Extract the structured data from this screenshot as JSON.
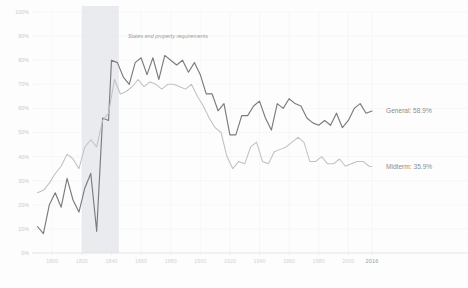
{
  "chart_data": {
    "type": "line",
    "title": "",
    "subtitle": "",
    "xlabel": "",
    "ylabel": "",
    "ylim": [
      0,
      100
    ],
    "xlim": [
      1789,
      2016
    ],
    "grid": true,
    "legend_position": "right-inline",
    "y_ticks": [
      "0%",
      "10%",
      "20%",
      "30%",
      "40%",
      "50%",
      "60%",
      "70%",
      "80%",
      "90%",
      "100%"
    ],
    "y_tick_values": [
      0,
      10,
      20,
      30,
      40,
      50,
      60,
      70,
      80,
      90,
      100
    ],
    "x_ticks": [
      "1800",
      "1820",
      "1840",
      "1860",
      "1880",
      "1900",
      "1920",
      "1940",
      "1960",
      "1980",
      "2000",
      "2016"
    ],
    "x_tick_values": [
      1800,
      1820,
      1840,
      1860,
      1880,
      1900,
      1920,
      1940,
      1960,
      1980,
      2000,
      2016
    ],
    "annotations": [
      {
        "name": "property-requirements-band",
        "text": "States end property requirements",
        "x_start": 1820,
        "x_end": 1845,
        "color": "#e4e7ea"
      }
    ],
    "series": [
      {
        "name": "General",
        "label": "General: 58.9%",
        "end_value": 58.9,
        "color": "#7b7b7f",
        "width": 1.15,
        "x": [
          1790,
          1794,
          1798,
          1802,
          1806,
          1810,
          1814,
          1818,
          1822,
          1826,
          1830,
          1834,
          1838,
          1840,
          1844,
          1848,
          1852,
          1856,
          1860,
          1864,
          1868,
          1872,
          1876,
          1880,
          1884,
          1888,
          1892,
          1896,
          1900,
          1904,
          1908,
          1912,
          1916,
          1920,
          1924,
          1928,
          1932,
          1936,
          1940,
          1944,
          1948,
          1952,
          1956,
          1960,
          1964,
          1968,
          1972,
          1976,
          1980,
          1984,
          1988,
          1992,
          1996,
          2000,
          2004,
          2008,
          2012,
          2016
        ],
        "values": [
          11.0,
          8.0,
          20.0,
          25.0,
          19.0,
          31.0,
          22.0,
          17.0,
          27.0,
          33.0,
          9.0,
          56.0,
          55.0,
          80.0,
          79.0,
          73.0,
          70.0,
          79.0,
          81.0,
          74.0,
          81.0,
          72.0,
          82.0,
          80.0,
          78.0,
          80.0,
          75.0,
          79.0,
          74.0,
          66.0,
          66.0,
          59.0,
          62.0,
          49.0,
          49.0,
          57.0,
          57.0,
          61.0,
          63.0,
          56.0,
          51.0,
          62.0,
          60.0,
          64.0,
          62.0,
          61.0,
          56.0,
          54.0,
          53.0,
          55.0,
          53.0,
          58.0,
          52.0,
          55.0,
          60.0,
          62.0,
          58.0,
          58.9
        ]
      },
      {
        "name": "Midterm",
        "label": "Midterm: 35.9%",
        "end_value": 35.9,
        "color": "#c0c1c4",
        "width": 1.05,
        "x": [
          1790,
          1794,
          1798,
          1802,
          1806,
          1810,
          1814,
          1818,
          1822,
          1826,
          1830,
          1834,
          1838,
          1842,
          1846,
          1850,
          1854,
          1858,
          1862,
          1866,
          1870,
          1874,
          1878,
          1882,
          1886,
          1890,
          1894,
          1898,
          1902,
          1906,
          1910,
          1914,
          1918,
          1922,
          1926,
          1930,
          1934,
          1938,
          1942,
          1946,
          1950,
          1954,
          1958,
          1962,
          1966,
          1970,
          1974,
          1978,
          1982,
          1986,
          1990,
          1994,
          1998,
          2002,
          2006,
          2010,
          2014,
          2016
        ],
        "values": [
          25.0,
          26.0,
          29.0,
          33.0,
          36.0,
          41.0,
          39.0,
          35.0,
          44.0,
          47.0,
          44.0,
          55.0,
          58.0,
          72.0,
          66.0,
          67.0,
          69.0,
          72.0,
          69.0,
          71.0,
          70.0,
          68.0,
          70.0,
          70.0,
          69.0,
          68.0,
          70.0,
          65.0,
          61.0,
          56.0,
          52.0,
          50.0,
          40.0,
          35.0,
          38.0,
          37.0,
          44.0,
          46.0,
          38.0,
          37.0,
          42.0,
          43.0,
          44.0,
          46.0,
          48.0,
          46.0,
          38.0,
          38.0,
          40.0,
          37.0,
          37.0,
          39.0,
          36.0,
          37.0,
          38.0,
          38.0,
          36.0,
          35.9
        ]
      }
    ]
  },
  "axes": {
    "y_axis_name": "turnout-percent-axis",
    "x_axis_name": "year-axis"
  }
}
